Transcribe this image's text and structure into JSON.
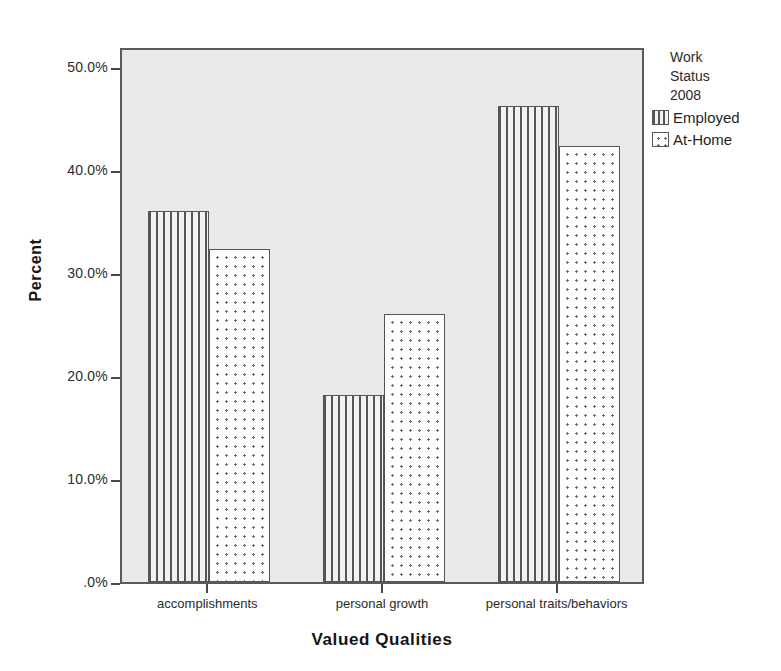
{
  "chart_data": {
    "type": "bar",
    "title": "",
    "xlabel": "Valued Qualities",
    "ylabel": "Percent",
    "categories": [
      "accomplishments",
      "personal growth",
      "personal traits/behaviors"
    ],
    "series": [
      {
        "name": "Employed",
        "values": [
          36.0,
          18.1,
          46.2
        ],
        "pattern": "vertical-lines"
      },
      {
        "name": "At-Home",
        "values": [
          32.3,
          26.0,
          42.3
        ],
        "pattern": "dots"
      }
    ],
    "ylim": [
      0,
      52
    ],
    "ytick_values": [
      0,
      10,
      20,
      30,
      40,
      50
    ],
    "ytick_labels": [
      ".0%",
      "10.0%",
      "20.0%",
      "30.0%",
      "40.0%",
      "50.0%"
    ],
    "grid": false,
    "legend_position": "right"
  },
  "axes": {
    "y_title": "Percent",
    "x_title": "Valued Qualities"
  },
  "legend": {
    "title": "Work\nStatus\n2008",
    "entries": [
      {
        "label": "Employed",
        "swatch": "vertical-lines-swatch"
      },
      {
        "label": "At-Home",
        "swatch": "dots-swatch"
      }
    ]
  },
  "colors": {
    "plot_background": "#e9e9e9",
    "frame": "#5a5a5a",
    "hatch": "#565656",
    "text": "#1a1a1a"
  }
}
